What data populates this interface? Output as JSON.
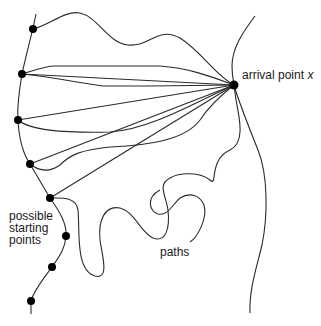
{
  "diagram": {
    "type": "paths-to-arrival-point",
    "labels": {
      "arrival": "arrival point ",
      "arrival_var": "x",
      "starting_line1": "possible",
      "starting_line2": "starting",
      "starting_line3": "points",
      "paths": "paths"
    },
    "colors": {
      "stroke": "#2a2a2a",
      "dot": "#000000",
      "text": "#1a1a1a",
      "background": "#ffffff"
    },
    "arrival_point": {
      "x": 234,
      "y": 85
    },
    "starting_points": [
      {
        "x": 33,
        "y": 29
      },
      {
        "x": 22,
        "y": 74
      },
      {
        "x": 18,
        "y": 120
      },
      {
        "x": 30,
        "y": 164
      },
      {
        "x": 50,
        "y": 198
      },
      {
        "x": 66,
        "y": 236
      },
      {
        "x": 52,
        "y": 267
      },
      {
        "x": 31,
        "y": 301
      }
    ]
  }
}
